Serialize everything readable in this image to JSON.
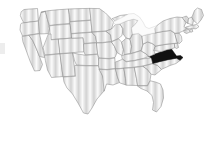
{
  "figure": {
    "title": "United States choropleth map",
    "subtitle": "Contiguous United States with one state highlighted",
    "width": 210,
    "height": 142,
    "background_color": "#ffffff"
  },
  "legend": {
    "visible": false,
    "highlight_label": "Highlighted state",
    "base_label": "Other states"
  },
  "style": {
    "highlight_color": "#111111",
    "base_fill_color": "#d8d8d8",
    "hatch_color": "#c9c9c9",
    "border_color": "#8c8c8c",
    "water_fill_color": "#fbfbfb",
    "fill_pattern": "vertical-hatch"
  },
  "map_data": {
    "type": "choropleth",
    "region": "USA-contiguous",
    "projection": "albers-usa",
    "highlighted": [
      "Virginia"
    ],
    "states": [
      {
        "code": "WA",
        "name": "Washington",
        "highlighted": false
      },
      {
        "code": "OR",
        "name": "Oregon",
        "highlighted": false
      },
      {
        "code": "CA",
        "name": "California",
        "highlighted": false
      },
      {
        "code": "NV",
        "name": "Nevada",
        "highlighted": false
      },
      {
        "code": "ID",
        "name": "Idaho",
        "highlighted": false
      },
      {
        "code": "MT",
        "name": "Montana",
        "highlighted": false
      },
      {
        "code": "WY",
        "name": "Wyoming",
        "highlighted": false
      },
      {
        "code": "UT",
        "name": "Utah",
        "highlighted": false
      },
      {
        "code": "AZ",
        "name": "Arizona",
        "highlighted": false
      },
      {
        "code": "NM",
        "name": "New Mexico",
        "highlighted": false
      },
      {
        "code": "CO",
        "name": "Colorado",
        "highlighted": false
      },
      {
        "code": "ND",
        "name": "North Dakota",
        "highlighted": false
      },
      {
        "code": "SD",
        "name": "South Dakota",
        "highlighted": false
      },
      {
        "code": "NE",
        "name": "Nebraska",
        "highlighted": false
      },
      {
        "code": "KS",
        "name": "Kansas",
        "highlighted": false
      },
      {
        "code": "OK",
        "name": "Oklahoma",
        "highlighted": false
      },
      {
        "code": "TX",
        "name": "Texas",
        "highlighted": false
      },
      {
        "code": "MN",
        "name": "Minnesota",
        "highlighted": false
      },
      {
        "code": "IA",
        "name": "Iowa",
        "highlighted": false
      },
      {
        "code": "MO",
        "name": "Missouri",
        "highlighted": false
      },
      {
        "code": "AR",
        "name": "Arkansas",
        "highlighted": false
      },
      {
        "code": "LA",
        "name": "Louisiana",
        "highlighted": false
      },
      {
        "code": "WI",
        "name": "Wisconsin",
        "highlighted": false
      },
      {
        "code": "IL",
        "name": "Illinois",
        "highlighted": false
      },
      {
        "code": "MI",
        "name": "Michigan",
        "highlighted": false
      },
      {
        "code": "IN",
        "name": "Indiana",
        "highlighted": false
      },
      {
        "code": "OH",
        "name": "Ohio",
        "highlighted": false
      },
      {
        "code": "KY",
        "name": "Kentucky",
        "highlighted": false
      },
      {
        "code": "TN",
        "name": "Tennessee",
        "highlighted": false
      },
      {
        "code": "MS",
        "name": "Mississippi",
        "highlighted": false
      },
      {
        "code": "AL",
        "name": "Alabama",
        "highlighted": false
      },
      {
        "code": "GA",
        "name": "Georgia",
        "highlighted": false
      },
      {
        "code": "FL",
        "name": "Florida",
        "highlighted": false
      },
      {
        "code": "SC",
        "name": "South Carolina",
        "highlighted": false
      },
      {
        "code": "NC",
        "name": "North Carolina",
        "highlighted": false
      },
      {
        "code": "VA",
        "name": "Virginia",
        "highlighted": true
      },
      {
        "code": "WV",
        "name": "West Virginia",
        "highlighted": false
      },
      {
        "code": "MD",
        "name": "Maryland",
        "highlighted": false
      },
      {
        "code": "DE",
        "name": "Delaware",
        "highlighted": false
      },
      {
        "code": "PA",
        "name": "Pennsylvania",
        "highlighted": false
      },
      {
        "code": "NJ",
        "name": "New Jersey",
        "highlighted": false
      },
      {
        "code": "NY",
        "name": "New York",
        "highlighted": false
      },
      {
        "code": "CT",
        "name": "Connecticut",
        "highlighted": false
      },
      {
        "code": "RI",
        "name": "Rhode Island",
        "highlighted": false
      },
      {
        "code": "MA",
        "name": "Massachusetts",
        "highlighted": false
      },
      {
        "code": "VT",
        "name": "Vermont",
        "highlighted": false
      },
      {
        "code": "NH",
        "name": "New Hampshire",
        "highlighted": false
      },
      {
        "code": "ME",
        "name": "Maine",
        "highlighted": false
      }
    ]
  }
}
